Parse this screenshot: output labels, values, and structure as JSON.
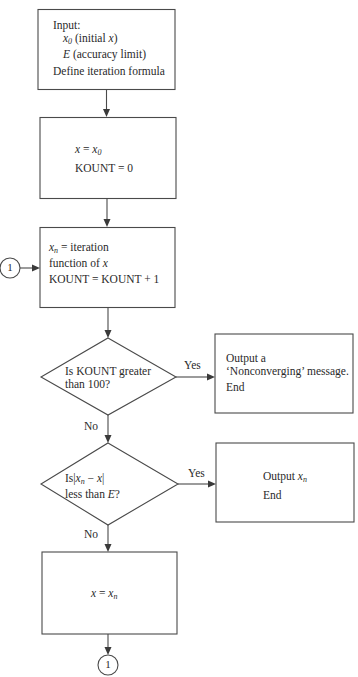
{
  "diagram": {
    "type": "flowchart",
    "nodes": {
      "input_box": {
        "line1": "Input:",
        "line2_var": "x",
        "line2_sub": "0",
        "line2_rest": " (initial ",
        "line2_var2": "x",
        "line2_close": ")",
        "line3_var": "E",
        "line3_rest": " (accuracy limit)",
        "line4": "Define iteration formula"
      },
      "init_box": {
        "line1_var": "x",
        "line1_eq": " = ",
        "line1_var2": "x",
        "line1_sub": "0",
        "line2": "KOUNT = 0"
      },
      "iterate_box": {
        "line1_var": "x",
        "line1_sub": "n",
        "line1_rest": " = iteration",
        "line2_text": "function of ",
        "line2_var": "x",
        "line3": "KOUNT = KOUNT + 1"
      },
      "decision_kount": {
        "line1": "Is KOUNT greater",
        "line2": "than 100?"
      },
      "nonconverge_box": {
        "line1": "Output a",
        "line2": "‘Nonconverging’ message.",
        "line3": "End"
      },
      "decision_accuracy": {
        "line1_pre": "Is|",
        "line1_var": "x",
        "line1_sub": "n",
        "line1_mid": " − ",
        "line1_var2": "x",
        "line1_post": "|",
        "line2_pre": "less than ",
        "line2_var": "E",
        "line2_post": "?"
      },
      "output_box": {
        "line1_pre": "Output ",
        "line1_var": "x",
        "line1_sub": "n",
        "line2": "End"
      },
      "update_box": {
        "line1_var": "x",
        "line1_eq": " = ",
        "line1_var2": "x",
        "line1_sub": "n"
      },
      "connector_in": {
        "label": "1"
      },
      "connector_out": {
        "label": "1"
      }
    },
    "edge_labels": {
      "kount_yes": "Yes",
      "kount_no": "No",
      "accuracy_yes": "Yes",
      "accuracy_no": "No"
    },
    "colors": {
      "stroke": "#4a4a4a",
      "text": "#2a2a2a",
      "background": "#ffffff"
    }
  }
}
